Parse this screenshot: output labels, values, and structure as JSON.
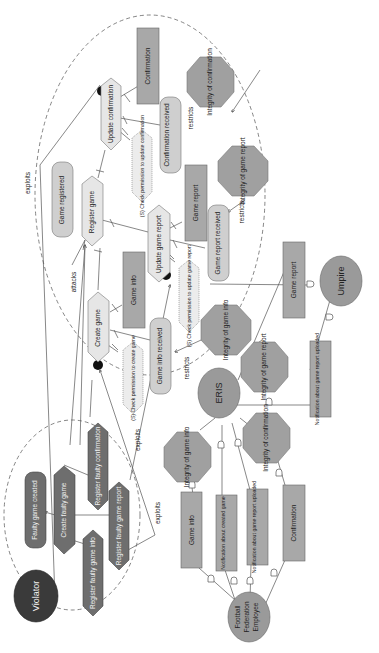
{
  "diagram": {
    "orientation": "rotated-90-ccw",
    "colors": {
      "background": "#ffffff",
      "resource_box": "#a8a8a8",
      "goal_rounded": "#cfcfcf",
      "task_hexagon": "#e6e6e6",
      "softgoal_octagon": "#a0a0a0",
      "actor_circle": "#9a9a9a",
      "violator_circle": "#3a3a3a",
      "malicious_task": "#6e6e6e",
      "malicious_goal": "#6e6e6e",
      "permission_hex": "#ececec",
      "edge": "#555555"
    },
    "actors": {
      "violator": "Violator",
      "eris": "ERIS",
      "umpire": "Umpire",
      "employee": "Football Federation Employee"
    },
    "eris_boundary": {
      "tasks": {
        "update_confirmation": "Update confirmation",
        "register_game": "Register game",
        "update_game_report": "Update game report",
        "create_game": "Create game"
      },
      "goals": {
        "game_registered": "Game registered",
        "confirmation_received": "Confirmation received",
        "game_report_received": "Game report received",
        "game_info_received": "Game info received"
      },
      "resources": {
        "confirmation": "Confirmation",
        "game_report": "Game report",
        "game_info": "Game info"
      },
      "permissions": {
        "perm_update_confirmation": "(S) Check permission to update confirmation",
        "perm_update_game_report": "(S) Check permission to update game report",
        "perm_create_game": "(S) Check permission to create game"
      },
      "softgoals": {
        "integrity_confirmation": "Integrity of confirmation",
        "integrity_game_report": "Integrity of game report",
        "integrity_game_info": "Integrity of game info"
      }
    },
    "violator_boundary": {
      "goal": "Faulty game created",
      "tasks": {
        "create_faulty_game": "Create faulty game",
        "register_faulty_confirmation": "Register faulty confirmation",
        "register_faulty_game_report": "Register faulty game report",
        "register_faulty_game_info": "Register faulty game info"
      }
    },
    "dependencies": {
      "game_report": "Game report",
      "notif_game_report_uploaded": "Notification about game report uploaded",
      "integrity_game_report": "Integrity of game report",
      "integrity_game_info": "Integrity of game info",
      "integrity_confirmation": "Integrity of confirmation",
      "game_info": "Game info",
      "notif_created_game": "Notification about created game",
      "notif_game_report_uploaded_2": "Notification about game report uploaded",
      "confirmation": "Confirmation"
    },
    "edge_labels": {
      "exploits_1": "exploits",
      "attacks": "attacks",
      "restricts_1": "restricts",
      "restricts_2": "restricts",
      "restricts_3": "restricts",
      "exploits_2": "exploits",
      "exploits_3": "exploits"
    }
  }
}
